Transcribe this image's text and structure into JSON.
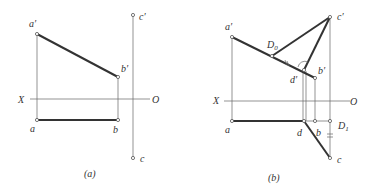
{
  "figure": {
    "panel_a": {
      "caption": "(a)",
      "axis": {
        "left_label": "X",
        "right_label": "O"
      },
      "points": {
        "a_prime": "a′",
        "b_prime": "b′",
        "c_prime": "c′",
        "a": "a",
        "b": "b",
        "c": "c"
      }
    },
    "panel_b": {
      "caption": "(b)",
      "axis": {
        "left_label": "X",
        "right_label": "O"
      },
      "points": {
        "a_prime": "a′",
        "b_prime": "b′",
        "c_prime": "c′",
        "d_prime": "d′",
        "D0": "D",
        "D0_sub": "0",
        "a": "a",
        "b": "b",
        "c": "c",
        "d": "d",
        "D1": "D",
        "D1_sub": "1"
      }
    },
    "colors": {
      "line": "#333333",
      "thin": "#666666",
      "background": "#ffffff"
    }
  }
}
